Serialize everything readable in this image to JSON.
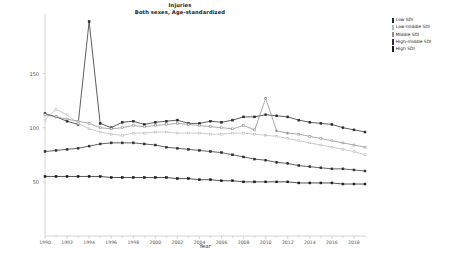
{
  "chart_data": {
    "type": "line",
    "title": "Injuries",
    "subtitle": "Both sexes, Age-standardized",
    "xlabel": "Year",
    "ylabel": "Deaths per 100,000",
    "xlim": [
      1990,
      2019
    ],
    "ylim": [
      0,
      205
    ],
    "yticks": [
      50,
      100,
      150
    ],
    "xticks": [
      1990,
      1992,
      1994,
      1996,
      1998,
      2000,
      2002,
      2004,
      2006,
      2008,
      2010,
      2012,
      2014,
      2016,
      2018
    ],
    "grid": false,
    "legend_position": "right",
    "x": [
      1990,
      1991,
      1992,
      1993,
      1994,
      1995,
      1996,
      1997,
      1998,
      1999,
      2000,
      2001,
      2002,
      2003,
      2004,
      2005,
      2006,
      2007,
      2008,
      2009,
      2010,
      2011,
      2012,
      2013,
      2014,
      2015,
      2016,
      2017,
      2018,
      2019
    ],
    "series": [
      {
        "name": "Low SDI",
        "color": "#2a2a2a",
        "marker": "square-filled",
        "values": [
          113,
          110,
          106,
          103,
          198,
          104,
          100,
          105,
          106,
          103,
          105,
          106,
          107,
          104,
          104,
          106,
          105,
          107,
          110,
          110,
          112,
          111,
          110,
          107,
          105,
          104,
          103,
          100,
          98,
          96
        ]
      },
      {
        "name": "Low-middle SDI",
        "color": "#b9b9b9",
        "marker": "square-open",
        "values": [
          107,
          117,
          112,
          104,
          99,
          96,
          94,
          93,
          95,
          95,
          96,
          96,
          95,
          95,
          95,
          94,
          94,
          95,
          95,
          94,
          93,
          92,
          90,
          88,
          86,
          84,
          82,
          80,
          78,
          75
        ]
      },
      {
        "name": "Middle SDI",
        "color": "#8c8c8c",
        "marker": "square-open",
        "values": [
          112,
          110,
          108,
          106,
          104,
          100,
          99,
          100,
          102,
          101,
          102,
          103,
          104,
          103,
          102,
          101,
          100,
          99,
          102,
          98,
          127,
          97,
          95,
          94,
          92,
          90,
          88,
          86,
          84,
          82
        ]
      },
      {
        "name": "High-middle SDI",
        "color": "#303030",
        "marker": "square-filled",
        "values": [
          78,
          79,
          80,
          81,
          83,
          85,
          86,
          86,
          86,
          85,
          84,
          82,
          81,
          80,
          79,
          78,
          77,
          75,
          73,
          71,
          70,
          68,
          67,
          65,
          64,
          63,
          62,
          62,
          61,
          60
        ]
      },
      {
        "name": "High SDI",
        "color": "#1a1a1a",
        "marker": "square-filled",
        "values": [
          55,
          55,
          55,
          55,
          55,
          55,
          54,
          54,
          54,
          54,
          54,
          54,
          53,
          53,
          52,
          52,
          51,
          51,
          50,
          50,
          50,
          50,
          50,
          49,
          49,
          49,
          49,
          48,
          48,
          48
        ]
      }
    ]
  },
  "legend": {
    "items": [
      {
        "label": "Low SDI"
      },
      {
        "label": "Low-middle SDI"
      },
      {
        "label": "Middle SDI"
      },
      {
        "label": "High-middle SDI"
      },
      {
        "label": "High SDI"
      }
    ]
  }
}
